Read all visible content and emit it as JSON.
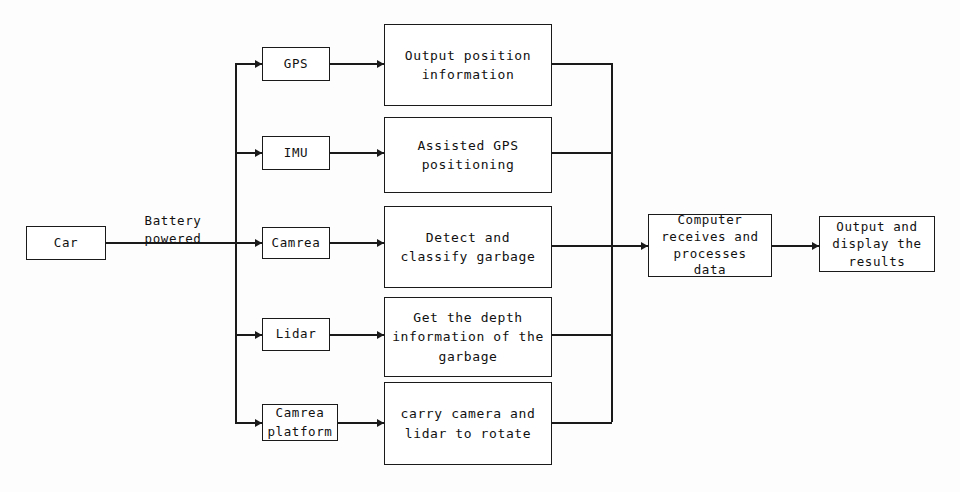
{
  "diagram": {
    "colors": {
      "line": "#1a1a1a",
      "text": "#111111",
      "background": "#fdfdfd",
      "box_fill": "#ffffff"
    },
    "source_node": {
      "label": "Car"
    },
    "edge_labels": {
      "power": "Battery\npowered"
    },
    "sensors": [
      {
        "id": "gps",
        "label": "GPS"
      },
      {
        "id": "imu",
        "label": "IMU"
      },
      {
        "id": "camera",
        "label": "Camrea"
      },
      {
        "id": "lidar",
        "label": "Lidar"
      },
      {
        "id": "camera-platform",
        "label": "Camrea\nplatform"
      }
    ],
    "functions": [
      {
        "id": "gps-function",
        "label": "Output position\ninformation"
      },
      {
        "id": "imu-function",
        "label": "Assisted GPS\npositioning"
      },
      {
        "id": "camera-function",
        "label": "Detect and\nclassify garbage"
      },
      {
        "id": "lidar-function",
        "label": "Get the depth\ninformation of the\ngarbage"
      },
      {
        "id": "platform-function",
        "label": "carry camera and\nlidar to rotate"
      }
    ],
    "processor_node": {
      "label": "Computer\nreceives and\nprocesses\ndata"
    },
    "output_node": {
      "label": "Output and\ndisplay the\nresults"
    }
  }
}
